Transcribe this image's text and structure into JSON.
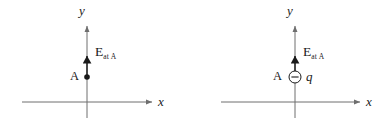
{
  "figure": {
    "background_color": "#ffffff",
    "line_color": "#6e6e6e",
    "text_color": "#1a1a1a",
    "width": 391,
    "height": 122
  },
  "panels": [
    {
      "id": "left",
      "axes": {
        "x_axis_label": "x",
        "y_axis_label": "y",
        "origin_x": 87,
        "origin_y": 102
      },
      "point": {
        "label": "A",
        "marker": "filled-dot",
        "x": 87,
        "y": 77
      },
      "charge": null,
      "field_vector": {
        "symbol": "E",
        "subscript": "at A",
        "direction": "up",
        "tail_y": 77,
        "head_y": 50
      }
    },
    {
      "id": "right",
      "axes": {
        "x_axis_label": "x",
        "y_axis_label": "y",
        "origin_x": 100,
        "origin_y": 102
      },
      "point": {
        "label": "A",
        "marker": "none",
        "x": 100,
        "y": 77
      },
      "charge": {
        "label": "q",
        "sign": "negative",
        "sign_glyph": "minus",
        "marker": "circled-minus",
        "x": 100,
        "y": 77
      },
      "field_vector": {
        "symbol": "E",
        "subscript": "at A",
        "direction": "up",
        "tail_y": 72,
        "head_y": 50
      }
    }
  ]
}
